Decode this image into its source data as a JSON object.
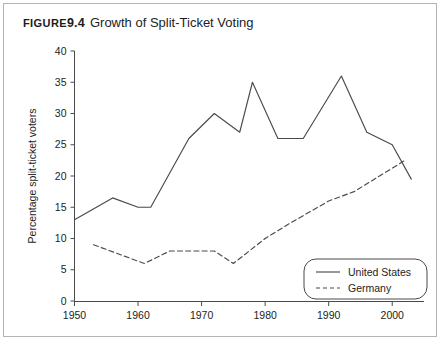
{
  "figure": {
    "label": "Figure",
    "number": "9.4",
    "title": "Growth of Split-Ticket Voting"
  },
  "chart_data": {
    "type": "line",
    "title": "Growth of Split-Ticket Voting",
    "xlabel": "",
    "ylabel": "Percentage split-ticket voters",
    "xlim": [
      1950,
      2005
    ],
    "ylim": [
      0,
      40
    ],
    "grid": false,
    "legend_position": "lower-right",
    "xticks": [
      1950,
      1960,
      1970,
      1980,
      1990,
      2000
    ],
    "xtick_labels": [
      "1950",
      "1960",
      "1970",
      "1980",
      "1990",
      "2000"
    ],
    "yticks": [
      0,
      5,
      10,
      15,
      20,
      25,
      30,
      35,
      40
    ],
    "ytick_labels": [
      "0",
      "5",
      "10",
      "15",
      "20",
      "25",
      "30",
      "35",
      "40"
    ],
    "series": [
      {
        "name": "United States",
        "style": "solid",
        "color": "#4a4a4a",
        "x": [
          1950,
          1956,
          1960,
          1962,
          1968,
          1972,
          1976,
          1978,
          1982,
          1986,
          1992,
          1996,
          2000,
          2003
        ],
        "values": [
          13,
          16.5,
          15,
          15,
          26,
          30,
          27,
          35,
          26,
          26,
          36,
          27,
          25,
          19.5
        ]
      },
      {
        "name": "Germany",
        "style": "dashed",
        "color": "#4a4a4a",
        "x": [
          1953,
          1961,
          1965,
          1969,
          1972,
          1975,
          1980,
          1984,
          1990,
          1994,
          1998,
          2002
        ],
        "values": [
          9,
          6,
          8,
          8,
          8,
          6,
          10,
          12.5,
          16,
          17.5,
          20,
          22.5
        ]
      }
    ]
  },
  "legend": {
    "items": [
      {
        "label": "United States",
        "style": "solid"
      },
      {
        "label": "Germany",
        "style": "dashed"
      }
    ]
  }
}
